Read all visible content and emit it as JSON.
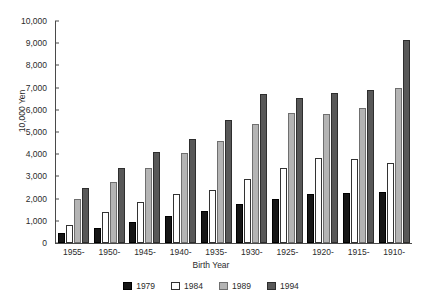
{
  "chart_data": {
    "type": "bar",
    "title": "",
    "xlabel": "Birth Year",
    "ylabel": "10,000 Yen",
    "ylim": [
      0,
      10000
    ],
    "ytick_labels": [
      "10,000",
      "9,000",
      "8,000",
      "7,000",
      "6,000",
      "5,000",
      "4,000",
      "3,000",
      "2,000",
      "1,000",
      "0"
    ],
    "ytick_values": [
      10000,
      9000,
      8000,
      7000,
      6000,
      5000,
      4000,
      3000,
      2000,
      1000,
      0
    ],
    "grid": false,
    "legend_position": "bottom",
    "categories": [
      "1955-",
      "1950-",
      "1945-",
      "1940-",
      "1935-",
      "1930-",
      "1925-",
      "1920-",
      "1915-",
      "1910-"
    ],
    "series": [
      {
        "name": "1979",
        "color": "#161616",
        "values": [
          430,
          680,
          960,
          1220,
          1430,
          1750,
          2000,
          2200,
          2250,
          2300
        ]
      },
      {
        "name": "1984",
        "color": "#ffffff",
        "values": [
          830,
          1400,
          1830,
          2210,
          2400,
          2900,
          3400,
          3820,
          3800,
          3600
        ]
      },
      {
        "name": "1989",
        "color": "#b4b4b4",
        "values": [
          2000,
          2760,
          3400,
          4050,
          4600,
          5350,
          5850,
          5800,
          6100,
          7000
        ]
      },
      {
        "name": "1994",
        "color": "#585858",
        "values": [
          2500,
          3400,
          4080,
          4670,
          5550,
          6700,
          6550,
          6750,
          6880,
          9150
        ]
      }
    ]
  }
}
